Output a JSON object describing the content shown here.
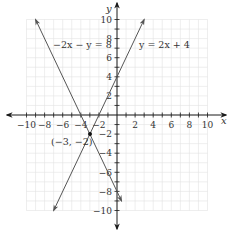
{
  "chart_data": {
    "type": "line",
    "title": "",
    "xlabel": "x",
    "ylabel": "y",
    "xlim": [
      -10,
      10
    ],
    "ylim": [
      -10,
      10
    ],
    "grid": true,
    "x_ticks": [
      -10,
      -8,
      -6,
      -4,
      -2,
      2,
      4,
      6,
      8,
      10
    ],
    "y_ticks": [
      10,
      8,
      6,
      4,
      2,
      -2,
      -4,
      -6,
      -8,
      -10
    ],
    "x_tick_labels": [
      "−10",
      "−8",
      "−6",
      "−4",
      "−2",
      "2",
      "4",
      "6",
      "8",
      "10"
    ],
    "y_tick_labels": [
      "10",
      "8",
      "6",
      "4",
      "2",
      "−2",
      "−4",
      "−6",
      "−8",
      "−10"
    ],
    "series": [
      {
        "name": "−2x − y = 8",
        "equation": "y = -2x - 8",
        "slope": -2,
        "intercept": -8,
        "x": [
          -9,
          0.5
        ],
        "y": [
          10,
          -9
        ]
      },
      {
        "name": "y = 2x + 4",
        "equation": "y = 2x + 4",
        "slope": 2,
        "intercept": 4,
        "x": [
          -7,
          3
        ],
        "y": [
          -10,
          10
        ]
      }
    ],
    "annotations": [
      {
        "type": "point",
        "x": -3,
        "y": -2,
        "label": "(−3, −2)"
      },
      {
        "type": "text",
        "text": "−2x − y = 8",
        "x": -6.5,
        "y": 7.5
      },
      {
        "type": "text",
        "text": "y = 2x + 4",
        "x": 4.5,
        "y": 7.5
      }
    ]
  },
  "labels": {
    "x_axis": "x",
    "y_axis": "y",
    "line1": "−2x − y = 8",
    "line2": "y = 2x + 4",
    "point": "(−3, −2)"
  },
  "colors": {
    "line": "#555555",
    "axis": "#1a1a1a",
    "grid": "#e2e2e2"
  }
}
